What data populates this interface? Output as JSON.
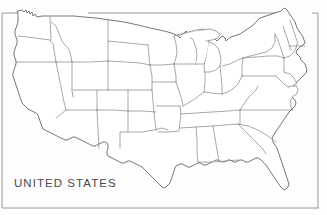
{
  "figure": {
    "caption": "UNITED STATES",
    "background_color": "#fdfdfd",
    "border_color": "#9a9a9a",
    "outline_color": "#4a4a4a",
    "state_border_color": "#5f5f5f",
    "caption_color": "#4a4a4a",
    "width": 327,
    "height": 215
  },
  "map": {
    "title": "UNITED STATES",
    "region": "Contiguous United States",
    "projection_note": "outline map with state boundaries",
    "states": [
      "Washington",
      "Oregon",
      "California",
      "Nevada",
      "Idaho",
      "Montana",
      "Wyoming",
      "Utah",
      "Arizona",
      "Colorado",
      "New Mexico",
      "North Dakota",
      "South Dakota",
      "Nebraska",
      "Kansas",
      "Oklahoma",
      "Texas",
      "Minnesota",
      "Iowa",
      "Missouri",
      "Arkansas",
      "Louisiana",
      "Wisconsin",
      "Illinois",
      "Michigan",
      "Indiana",
      "Ohio",
      "Kentucky",
      "Tennessee",
      "Mississippi",
      "Alabama",
      "Georgia",
      "Florida",
      "South Carolina",
      "North Carolina",
      "Virginia",
      "West Virginia",
      "Maryland",
      "Delaware",
      "Pennsylvania",
      "New Jersey",
      "New York",
      "Connecticut",
      "Rhode Island",
      "Massachusetts",
      "Vermont",
      "New Hampshire",
      "Maine"
    ]
  }
}
